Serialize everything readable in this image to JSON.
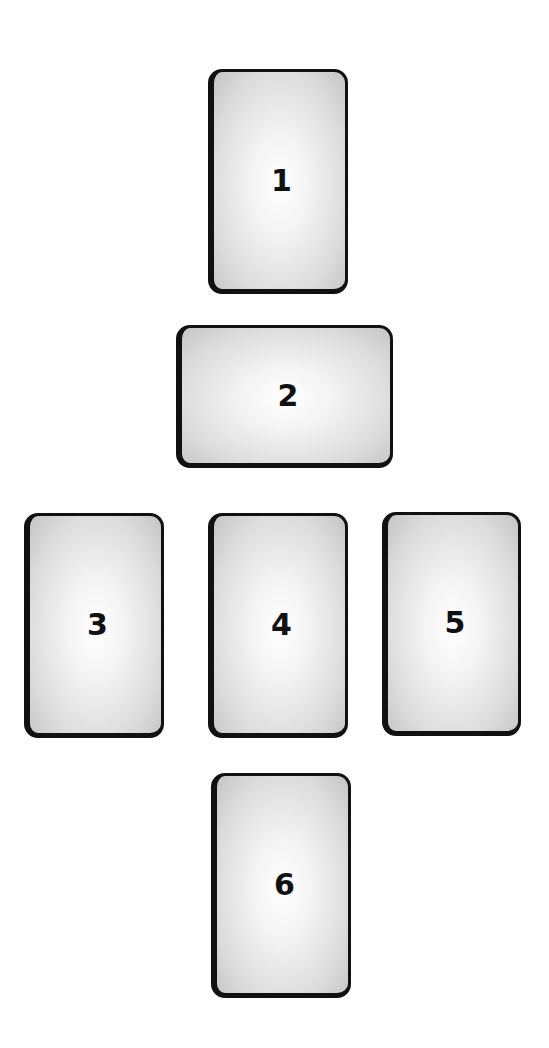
{
  "spread": {
    "title": "Six-card layout",
    "colors": {
      "background": "#ffffff",
      "card_border": "#111111",
      "card_center": "#ffffff",
      "card_edge": "#c4c4c4",
      "number": "#111111"
    },
    "cards": [
      {
        "position": "1",
        "label": "1",
        "orientation": "vertical",
        "x": 208,
        "y": 69,
        "w": 140,
        "h": 225
      },
      {
        "position": "2",
        "label": "2",
        "orientation": "horizontal",
        "x": 176,
        "y": 325,
        "w": 217,
        "h": 143
      },
      {
        "position": "3",
        "label": "3",
        "orientation": "vertical",
        "x": 24,
        "y": 513,
        "w": 140,
        "h": 225
      },
      {
        "position": "4",
        "label": "4",
        "orientation": "vertical",
        "x": 208,
        "y": 513,
        "w": 140,
        "h": 225
      },
      {
        "position": "5",
        "label": "5",
        "orientation": "vertical",
        "x": 382,
        "y": 512,
        "w": 139,
        "h": 224
      },
      {
        "position": "6",
        "label": "6",
        "orientation": "vertical",
        "x": 211,
        "y": 773,
        "w": 140,
        "h": 225
      }
    ]
  }
}
